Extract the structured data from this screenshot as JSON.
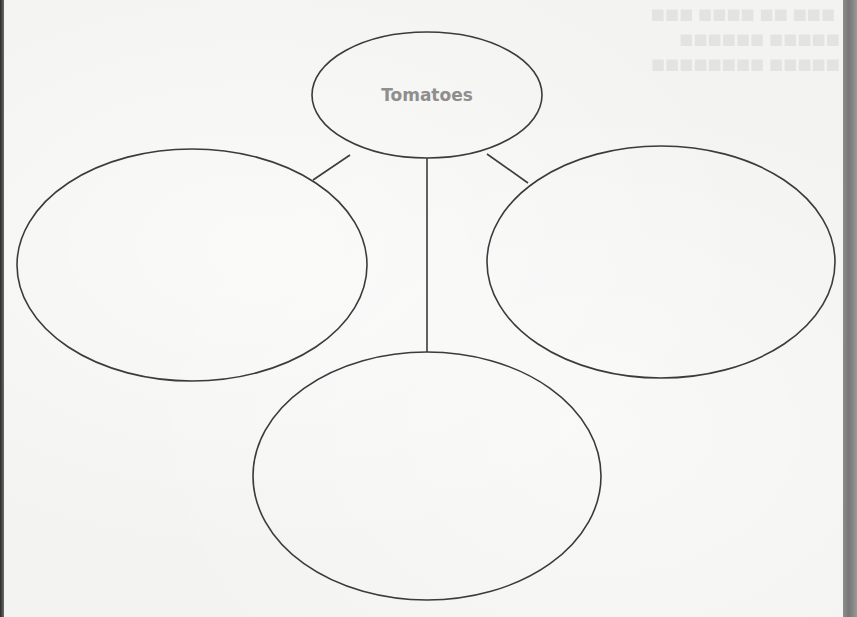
{
  "worksheet": {
    "title": "Graphic organizer (idea web)",
    "center_topic": "Tomatoes",
    "branches": [
      {
        "position": "left",
        "text": ""
      },
      {
        "position": "right",
        "text": ""
      },
      {
        "position": "bottom",
        "text": ""
      }
    ],
    "colors": {
      "paper": "#f3f3f1",
      "line": "#3b3b3b",
      "center_text": "#8e8e8e",
      "page_edge": "#808080"
    }
  }
}
